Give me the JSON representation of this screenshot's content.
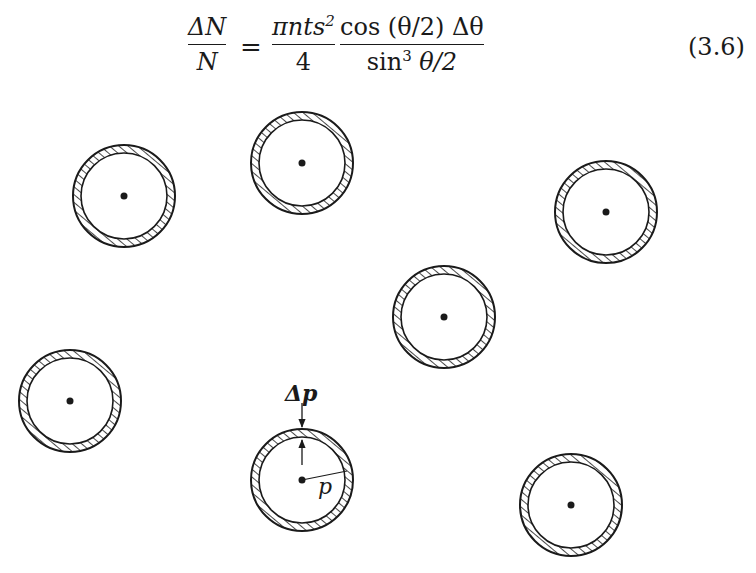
{
  "equation": {
    "lhs": {
      "numerator": "ΔN",
      "denominator": "N"
    },
    "equals": "=",
    "term1": {
      "numerator_base": "πnts",
      "numerator_sup": "2",
      "denominator": "4"
    },
    "term2": {
      "numerator": "cos (θ/2) Δθ",
      "denominator_pre": "sin",
      "denominator_sup": "3",
      "denominator_post": " θ/2"
    },
    "number": "(3.6)"
  },
  "figure": {
    "circles": [
      {
        "cx": 124,
        "cy": 196
      },
      {
        "cx": 302,
        "cy": 163
      },
      {
        "cx": 606,
        "cy": 212
      },
      {
        "cx": 444,
        "cy": 317
      },
      {
        "cx": 70,
        "cy": 401
      },
      {
        "cx": 302,
        "cy": 480
      },
      {
        "cx": 571,
        "cy": 505
      }
    ],
    "outer_radius": 51,
    "inner_radius": 43,
    "labels": {
      "delta_p": "Δp",
      "p": "p"
    }
  }
}
